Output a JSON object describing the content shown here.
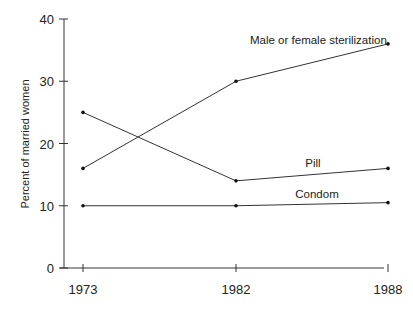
{
  "chart_data": {
    "type": "line",
    "title": "",
    "xlabel": "",
    "ylabel": "Percent of married women",
    "x": [
      "1973",
      "1982",
      "1988"
    ],
    "ylim": [
      0,
      40
    ],
    "yticks": [
      "0",
      "10",
      "20",
      "30",
      "40"
    ],
    "grid": false,
    "legend": "inline labels",
    "series": [
      {
        "name": "Male or female sterilization",
        "values": [
          16,
          30,
          36
        ]
      },
      {
        "name": "Pill",
        "values": [
          25,
          14,
          16
        ]
      },
      {
        "name": "Condom",
        "values": [
          10,
          10,
          10.5
        ]
      }
    ],
    "colors": {
      "line": "#333333",
      "axis": "#333333",
      "text": "#222222"
    }
  }
}
